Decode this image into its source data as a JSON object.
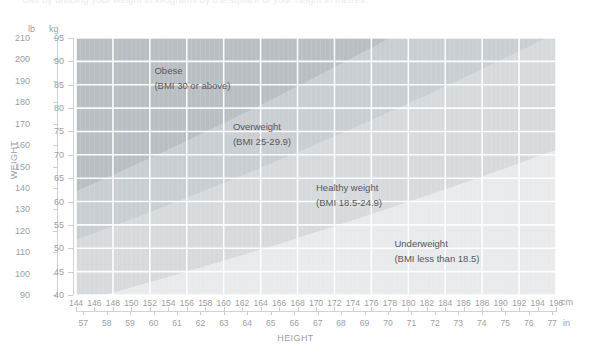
{
  "intro_text": "BMI by dividing your weight in kilograms by the square of your height in metres.",
  "axes": {
    "y_title": "WEIGHT",
    "x_title": "HEIGHT",
    "y_unit_primary": "lb",
    "y_unit_secondary": "kg",
    "x_unit_primary": "cm",
    "x_unit_secondary": "in"
  },
  "chart_data": {
    "type": "area",
    "xlabel": "HEIGHT",
    "ylabel": "WEIGHT",
    "x_unit": "cm",
    "x_unit_secondary": "in",
    "y_unit": "lb",
    "y_unit_secondary": "kg",
    "xlim": [
      144,
      196
    ],
    "ylim_lb": [
      90,
      210
    ],
    "ylim_kg": [
      40,
      95
    ],
    "grid": true,
    "legend_position": "inline-annotations",
    "x_ticks_cm": [
      144,
      146,
      148,
      150,
      152,
      154,
      156,
      158,
      160,
      162,
      164,
      166,
      168,
      170,
      172,
      174,
      176,
      178,
      180,
      182,
      184,
      186,
      188,
      190,
      192,
      194,
      196
    ],
    "x_ticks_in": [
      57,
      58,
      59,
      60,
      61,
      62,
      63,
      64,
      65,
      66,
      67,
      68,
      69,
      70,
      71,
      72,
      73,
      74,
      75,
      76,
      77
    ],
    "y_ticks_lb": [
      210,
      200,
      190,
      180,
      170,
      160,
      150,
      140,
      130,
      120,
      110,
      100,
      90
    ],
    "y_ticks_kg": [
      95,
      90,
      85,
      80,
      75,
      70,
      65,
      60,
      55,
      50,
      45,
      40
    ],
    "bands": [
      {
        "name": "Obese",
        "label": "Obese",
        "sub_label": "(BMI 30 or above)",
        "bmi_min": 30,
        "bmi_max": null,
        "color": "#b9bec2",
        "label_x_cm": 152.5,
        "label_y_kg": 88
      },
      {
        "name": "Overweight",
        "label": "Overweight",
        "sub_label": "(BMI 25-29.9)",
        "bmi_min": 25,
        "bmi_max": 29.9,
        "color": "#c9ced2",
        "label_x_cm": 161,
        "label_y_kg": 76
      },
      {
        "name": "Healthy weight",
        "label": "Healthy weight",
        "sub_label": "(BMI 18.5-24.9)",
        "bmi_min": 18.5,
        "bmi_max": 24.9,
        "color": "#d6dadd",
        "label_x_cm": 170,
        "label_y_kg": 63
      },
      {
        "name": "Underweight",
        "label": "Underweight",
        "sub_label": "(BMI less than 18.5)",
        "bmi_min": null,
        "bmi_max": 18.5,
        "color": "#e8eaec",
        "label_x_cm": 178.5,
        "label_y_kg": 51
      }
    ],
    "colors": {
      "grid": "#ffffff",
      "axis": "#cfd3d6",
      "text": "#9aa0a4",
      "label_text": "#55595c",
      "background": "#ffffff"
    }
  }
}
